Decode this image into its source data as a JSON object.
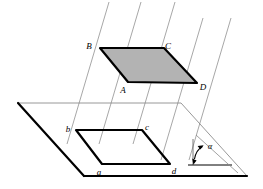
{
  "figure": {
    "colors": {
      "stroke": "#000000",
      "thin_stroke": "#8a8a8a",
      "shade_fill": "#b3b3b3",
      "background": "#ffffff"
    },
    "upper_region": {
      "name": "shaded-parallelogram-ABCD",
      "shaded": true,
      "fill": "#b3b3b3",
      "vertices": [
        {
          "label": "B",
          "x": 100,
          "y": 48,
          "label_x": 89,
          "label_y": 46
        },
        {
          "label": "C",
          "x": 164,
          "y": 48,
          "label_x": 167,
          "label_y": 46
        },
        {
          "label": "D",
          "x": 197,
          "y": 83,
          "label_x": 200,
          "label_y": 88
        },
        {
          "label": "A",
          "x": 128,
          "y": 82,
          "label_x": 121,
          "label_y": 92
        }
      ]
    },
    "lower_region": {
      "name": "projected-parallelogram-abcd",
      "shaded": false,
      "vertices": [
        {
          "label": "b",
          "x": 76,
          "y": 130,
          "label_x": 67,
          "label_y": 130
        },
        {
          "label": "c",
          "x": 142,
          "y": 130,
          "label_x": 145,
          "label_y": 128
        },
        {
          "label": "d",
          "x": 170,
          "y": 164,
          "label_x": 172,
          "label_y": 172
        },
        {
          "label": "a",
          "x": 102,
          "y": 164,
          "label_x": 96,
          "label_y": 173
        }
      ]
    },
    "base_plane": {
      "name": "base-plane-quadrilateral",
      "vertices": [
        {
          "x": 18,
          "y": 103
        },
        {
          "x": 181,
          "y": 103
        },
        {
          "x": 247,
          "y": 176
        },
        {
          "x": 84,
          "y": 176
        }
      ]
    },
    "projection_lines": {
      "name": "parallel-projection-rays",
      "count": 5,
      "lines": [
        {
          "x1": 109,
          "y1": 2,
          "x2": 67,
          "y2": 144
        },
        {
          "x1": 141,
          "y1": 2,
          "x2": 99,
          "y2": 144
        },
        {
          "x1": 175,
          "y1": 2,
          "x2": 133,
          "y2": 144
        },
        {
          "x1": 203,
          "y1": 18,
          "x2": 161,
          "y2": 160
        },
        {
          "x1": 231,
          "y1": 18,
          "x2": 189,
          "y2": 160
        }
      ]
    },
    "angle_marker": {
      "name": "inclination-angle-alpha",
      "symbol": "α",
      "label_x": 210,
      "label_y": 148,
      "vertical_line": {
        "x1": 193,
        "y1": 140,
        "x2": 193,
        "y2": 165
      },
      "base_line": {
        "x1": 188,
        "y1": 165,
        "x2": 232,
        "y2": 165
      },
      "ray_line": {
        "x1": 196,
        "y1": 136,
        "x2": 236,
        "y2": 172
      },
      "arrow_tip_x": 196,
      "arrow_tip_y": 144
    }
  }
}
